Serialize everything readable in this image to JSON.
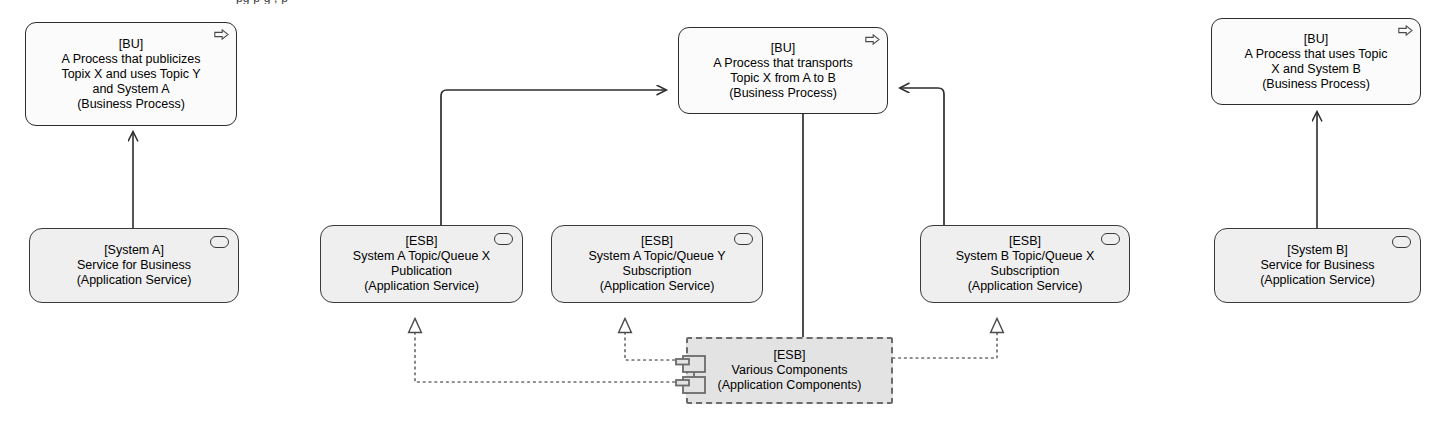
{
  "diagram": {
    "title_cropped": "pg p g , p",
    "notation": "ArchiMate / UML style architecture diagram",
    "colors": {
      "process_fill": "#fbfbfb",
      "appservice_fill": "#efeff0",
      "component_fill": "#e3e3e3",
      "stroke": "#2d2d2d",
      "dashed_stroke": "#6b6b6b",
      "background": "#ffffff"
    },
    "nodes": [
      {
        "id": "bu-left",
        "tag": "[BU]",
        "name": "A Process that publicizes\nTopix X and uses Topic Y\nand System A",
        "type_label": "(Business Process)",
        "shape": "process",
        "icon": "process-arrow-icon",
        "x": 25,
        "y": 22,
        "w": 212,
        "h": 104
      },
      {
        "id": "bu-center",
        "tag": "[BU]",
        "name": "A Process that transports\nTopic X from A to B",
        "type_label": "(Business Process)",
        "shape": "process",
        "icon": "process-arrow-icon",
        "x": 678,
        "y": 27,
        "w": 210,
        "h": 87
      },
      {
        "id": "bu-right",
        "tag": "[BU]",
        "name": "A Process that uses Topic\nX and System B",
        "type_label": "(Business Process)",
        "shape": "process",
        "icon": "process-arrow-icon",
        "x": 1211,
        "y": 18,
        "w": 210,
        "h": 87
      },
      {
        "id": "svc-system-a",
        "tag": "[System A]",
        "name": "Service for Business",
        "type_label": "(Application Service)",
        "shape": "appservice",
        "icon": "service-oval-icon",
        "x": 29,
        "y": 228,
        "w": 210,
        "h": 75
      },
      {
        "id": "esb-a-pub",
        "tag": "[ESB]",
        "name": "System A Topic/Queue X\nPublication",
        "type_label": "(Application Service)",
        "shape": "appservice",
        "icon": "service-oval-icon",
        "x": 320,
        "y": 225,
        "w": 203,
        "h": 78
      },
      {
        "id": "esb-a-sub",
        "tag": "[ESB]",
        "name": "System A Topic/Queue Y\nSubscription",
        "type_label": "(Application Service)",
        "shape": "appservice",
        "icon": "service-oval-icon",
        "x": 551,
        "y": 225,
        "w": 212,
        "h": 78
      },
      {
        "id": "esb-b-sub",
        "tag": "[ESB]",
        "name": "System B Topic/Queue X\nSubscription",
        "type_label": "(Application Service)",
        "shape": "appservice",
        "icon": "service-oval-icon",
        "x": 920,
        "y": 225,
        "w": 210,
        "h": 78
      },
      {
        "id": "svc-system-b",
        "tag": "[System B]",
        "name": "Service for Business",
        "type_label": "(Application Service)",
        "shape": "appservice",
        "icon": "service-oval-icon",
        "x": 1214,
        "y": 228,
        "w": 207,
        "h": 75
      },
      {
        "id": "esb-components",
        "tag": "[ESB]",
        "name": "Various Components",
        "type_label": "(Application Components)",
        "shape": "component",
        "icon": "uml-component-icon",
        "x": 686,
        "y": 337,
        "w": 207,
        "h": 67
      }
    ],
    "edges": [
      {
        "id": "e1",
        "from": "svc-system-a",
        "to": "bu-left",
        "style": "solid",
        "arrow": "open-arrow",
        "label": "serving"
      },
      {
        "id": "e2",
        "from": "esb-a-pub",
        "to": "bu-center",
        "style": "solid",
        "arrow": "open-arrow",
        "label": "serving"
      },
      {
        "id": "e3",
        "from": "esb-b-sub",
        "to": "bu-center",
        "style": "solid",
        "arrow": "open-arrow",
        "label": "serving"
      },
      {
        "id": "e4",
        "from": "svc-system-b",
        "to": "bu-right",
        "style": "solid",
        "arrow": "open-arrow",
        "label": "serving"
      },
      {
        "id": "e5",
        "from": "bu-center",
        "to": "esb-components",
        "style": "solid",
        "arrow": "none",
        "label": "association"
      },
      {
        "id": "e6",
        "from": "esb-components",
        "to": "esb-a-pub",
        "style": "dotted",
        "arrow": "hollow-triangle",
        "label": "realization"
      },
      {
        "id": "e7",
        "from": "esb-components",
        "to": "esb-a-sub",
        "style": "dotted",
        "arrow": "hollow-triangle",
        "label": "realization"
      },
      {
        "id": "e8",
        "from": "esb-components",
        "to": "esb-b-sub",
        "style": "dotted",
        "arrow": "hollow-triangle",
        "label": "realization"
      }
    ]
  }
}
